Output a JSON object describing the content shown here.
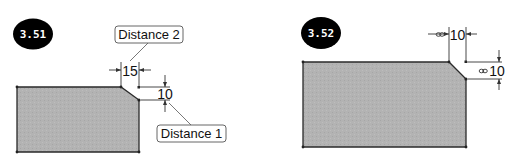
{
  "figures": [
    {
      "id": "fig-3-51",
      "badge_label": "3.51",
      "dimensions": {
        "horizontal": {
          "value": "15"
        },
        "vertical": {
          "value": "10"
        }
      },
      "callouts": {
        "top": "Distance 2",
        "bottom": "Distance 1"
      }
    },
    {
      "id": "fig-3-52",
      "badge_label": "3.52",
      "dimensions": {
        "horizontal": {
          "value": "10",
          "icon": "link-icon"
        },
        "vertical": {
          "value": "10",
          "icon": "link-icon"
        }
      }
    }
  ],
  "colors": {
    "badge_fill": "#000000",
    "shape_fill": "#b3b3b3",
    "shape_stroke": "#2a2a2a",
    "dim_line": "#333333",
    "callout_border": "#555555"
  }
}
